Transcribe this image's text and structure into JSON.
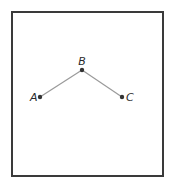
{
  "diagram": {
    "frame": {
      "x": 11,
      "y": 11,
      "width": 151,
      "height": 164,
      "color": "#3a3a3a"
    },
    "edge_color": "#9a9a9a",
    "point_color": "#333333",
    "points": [
      {
        "label": "A",
        "x": 40,
        "y": 97,
        "label_x": 30,
        "label_y": 101,
        "anchor": "start"
      },
      {
        "label": "B",
        "x": 82,
        "y": 70,
        "label_x": 82,
        "label_y": 65,
        "anchor": "middle"
      },
      {
        "label": "C",
        "x": 122,
        "y": 97,
        "label_x": 126,
        "label_y": 101,
        "anchor": "start"
      }
    ],
    "edges": [
      {
        "from": "A",
        "to": "B"
      },
      {
        "from": "B",
        "to": "C"
      }
    ]
  }
}
